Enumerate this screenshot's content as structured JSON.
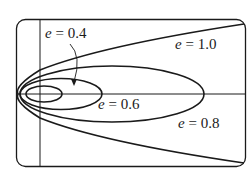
{
  "diagram": {
    "type": "conic-sections-by-eccentricity",
    "stroke_color": "#1a1a1a",
    "background": "#ffffff",
    "curves": [
      {
        "id": "e04",
        "eccentricity": "0.4",
        "kind": "ellipse",
        "label": {
          "var": "e",
          "eq": " = ",
          "value": "0.4"
        }
      },
      {
        "id": "e06",
        "eccentricity": "0.6",
        "kind": "ellipse",
        "label": {
          "var": "e",
          "eq": " = ",
          "value": "0.6"
        }
      },
      {
        "id": "e08",
        "eccentricity": "0.8",
        "kind": "ellipse",
        "label": {
          "var": "e",
          "eq": " = ",
          "value": "0.8"
        }
      },
      {
        "id": "e10",
        "eccentricity": "1.0",
        "kind": "parabola",
        "label": {
          "var": "e",
          "eq": " = ",
          "value": "1.0"
        }
      }
    ],
    "annotation": {
      "arrow_from_label": "e = 0.4",
      "points_to": "smallest ellipse"
    }
  }
}
